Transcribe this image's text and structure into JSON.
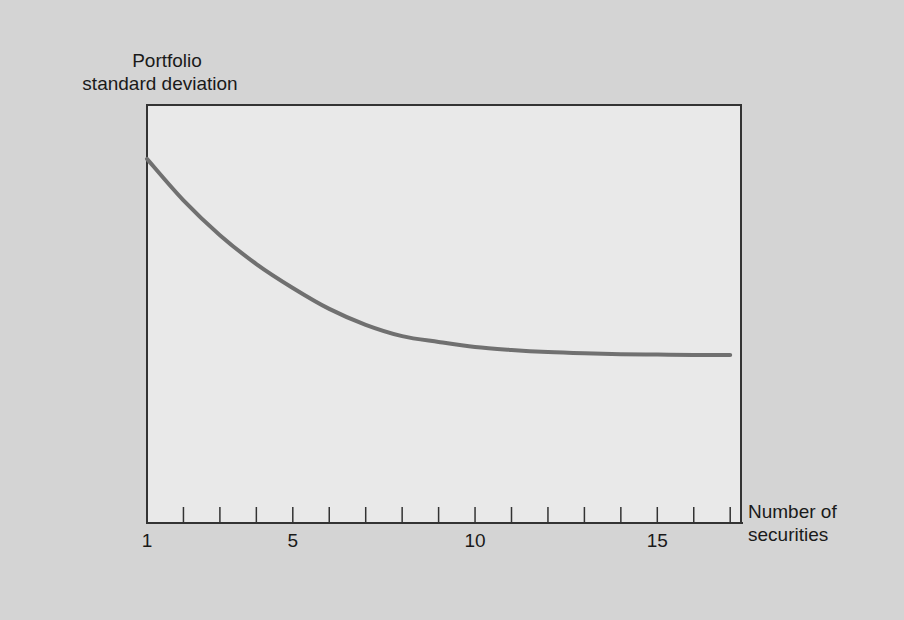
{
  "chart_data": {
    "type": "line",
    "title": "",
    "ylabel": "Portfolio standard deviation",
    "ylabel_lines": [
      "Portfolio",
      "standard deviation"
    ],
    "xlabel": "Number of securities",
    "xlabel_lines": [
      "Number of",
      "securities"
    ],
    "xlim": [
      1,
      17.6
    ],
    "ylim": [
      0,
      100
    ],
    "y_units": "relative (no scale shown)",
    "x_ticks": [
      1,
      2,
      3,
      4,
      5,
      6,
      7,
      8,
      9,
      10,
      11,
      12,
      13,
      14,
      15,
      16,
      17
    ],
    "x_tick_labels": [
      {
        "x": 1,
        "label": "1"
      },
      {
        "x": 5,
        "label": "5"
      },
      {
        "x": 10,
        "label": "10"
      },
      {
        "x": 15,
        "label": "15"
      }
    ],
    "grid": false,
    "series": [
      {
        "name": "Portfolio standard deviation",
        "color": "#707070",
        "x": [
          1,
          2,
          3,
          4,
          5,
          6,
          7,
          8,
          9,
          10,
          11,
          12,
          13,
          14,
          15,
          16,
          17
        ],
        "y": [
          86.9,
          77.0,
          68.7,
          61.8,
          56.1,
          51.1,
          47.3,
          44.6,
          43.2,
          42.0,
          41.3,
          40.8,
          40.5,
          40.3,
          40.2,
          40.1,
          40.1
        ]
      }
    ]
  }
}
